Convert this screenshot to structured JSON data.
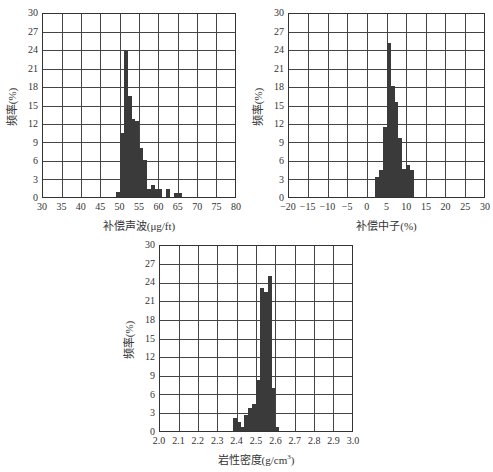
{
  "chart_data": [
    {
      "type": "bar",
      "title": "",
      "xlabel": "补偿声波(μg/ft)",
      "ylabel": "频率(%)",
      "xlim": [
        30,
        80
      ],
      "ylim": [
        0,
        30
      ],
      "grid": true,
      "xticks": [
        "30",
        "35",
        "40",
        "45",
        "50",
        "55",
        "60",
        "65",
        "70",
        "75",
        "80"
      ],
      "yticks": [
        "0",
        "3",
        "6",
        "9",
        "12",
        "15",
        "18",
        "21",
        "24",
        "27",
        "30"
      ],
      "bin_width": 1,
      "bins": [
        49,
        50,
        51,
        52,
        53,
        54,
        55,
        56,
        57,
        58,
        59,
        60,
        61,
        62,
        63,
        64,
        65
      ],
      "values": [
        0.8,
        10.5,
        24.0,
        16.5,
        12.8,
        12.4,
        8.1,
        6.0,
        1.3,
        1.9,
        1.3,
        1.3,
        0,
        1.3,
        0,
        0.6,
        0.6
      ]
    },
    {
      "type": "bar",
      "title": "",
      "xlabel": "补偿中子(%)",
      "ylabel": "频率(%)",
      "xlim": [
        -20,
        30
      ],
      "ylim": [
        0,
        30
      ],
      "grid": true,
      "xticks": [
        "−20",
        "−15",
        "−10",
        "−5",
        "0",
        "5",
        "10",
        "15",
        "20",
        "25",
        "30"
      ],
      "yticks": [
        "0",
        "3",
        "6",
        "9",
        "12",
        "15",
        "18",
        "21",
        "24",
        "27",
        "30"
      ],
      "bin_width": 1,
      "bins": [
        2,
        3,
        4,
        5,
        6,
        7,
        8,
        9,
        10,
        11
      ],
      "values": [
        3.3,
        4.5,
        11.4,
        25.3,
        18.2,
        15.6,
        9.6,
        4.6,
        5.2,
        4.5
      ]
    },
    {
      "type": "bar",
      "title": "",
      "xlabel": "岩性密度(g/cm",
      "xlabel_sup": "3",
      "xlabel_tail": ")",
      "ylabel": "频率(%)",
      "xlim": [
        2.0,
        3.0
      ],
      "ylim": [
        0,
        30
      ],
      "grid": true,
      "xticks": [
        "2.0",
        "2.1",
        "2.2",
        "2.3",
        "2.4",
        "2.5",
        "2.6",
        "2.7",
        "2.8",
        "2.9",
        "3.0"
      ],
      "yticks": [
        "0",
        "3",
        "6",
        "9",
        "12",
        "15",
        "18",
        "21",
        "24",
        "27",
        "30"
      ],
      "bin_width": 0.02,
      "bins": [
        2.38,
        2.4,
        2.42,
        2.44,
        2.46,
        2.48,
        2.5,
        2.52,
        2.54,
        2.56,
        2.58,
        2.6
      ],
      "values": [
        2.1,
        1.4,
        0.7,
        2.6,
        3.8,
        4.4,
        8.2,
        23.2,
        22.6,
        25.1,
        7.0,
        0.7
      ]
    }
  ]
}
